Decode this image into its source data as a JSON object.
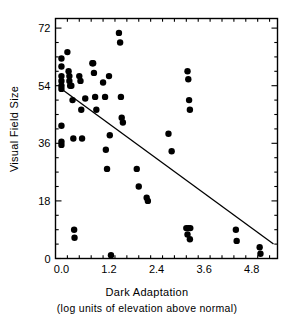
{
  "chart_data": {
    "type": "scatter",
    "title": "",
    "xlabel": "Dark Adaptation",
    "xlabel_sub": "(log units of elevation above normal)",
    "ylabel": "Visual Field Size",
    "xlim": [
      -0.15,
      5.45
    ],
    "ylim": [
      0,
      75
    ],
    "xticks": [
      0.0,
      1.2,
      2.4,
      3.6,
      4.8
    ],
    "xtick_labels": [
      "0.0",
      "1.2",
      "2.4",
      "3.6",
      "4.8"
    ],
    "yticks": [
      0,
      18,
      36,
      54,
      72
    ],
    "ytick_labels": [
      "0",
      "18",
      "36",
      "54",
      "72"
    ],
    "x_minor_step": 0.3,
    "y_minor_step": 4.5,
    "grid": false,
    "legend": null,
    "marker": "filled-circle",
    "marker_color": "#000000",
    "marker_size": 3.2,
    "points": [
      [
        0.0,
        62.5
      ],
      [
        0.0,
        60.0
      ],
      [
        0.0,
        57.0
      ],
      [
        0.0,
        55.5
      ],
      [
        0.0,
        54.0
      ],
      [
        0.0,
        53.0
      ],
      [
        0.0,
        41.5
      ],
      [
        0.0,
        36.5
      ],
      [
        0.0,
        35.5
      ],
      [
        0.15,
        64.5
      ],
      [
        0.18,
        58.5
      ],
      [
        0.2,
        57.0
      ],
      [
        0.2,
        55.5
      ],
      [
        0.22,
        54.0
      ],
      [
        0.25,
        54.0
      ],
      [
        0.28,
        49.5
      ],
      [
        0.3,
        37.5
      ],
      [
        0.32,
        9.0
      ],
      [
        0.33,
        6.5
      ],
      [
        0.45,
        57.0
      ],
      [
        0.48,
        55.5
      ],
      [
        0.5,
        46.5
      ],
      [
        0.52,
        37.5
      ],
      [
        0.6,
        50.0
      ],
      [
        0.78,
        61.0
      ],
      [
        0.8,
        61.0
      ],
      [
        0.82,
        58.0
      ],
      [
        0.85,
        50.5
      ],
      [
        0.88,
        46.5
      ],
      [
        1.05,
        55.0
      ],
      [
        1.1,
        50.5
      ],
      [
        1.12,
        34.0
      ],
      [
        1.15,
        28.0
      ],
      [
        1.2,
        57.0
      ],
      [
        1.22,
        38.5
      ],
      [
        1.25,
        1.0
      ],
      [
        1.45,
        70.5
      ],
      [
        1.48,
        67.5
      ],
      [
        1.5,
        50.5
      ],
      [
        1.52,
        44.0
      ],
      [
        1.55,
        42.5
      ],
      [
        1.9,
        28.0
      ],
      [
        1.95,
        22.5
      ],
      [
        2.15,
        19.0
      ],
      [
        2.18,
        18.0
      ],
      [
        2.7,
        39.0
      ],
      [
        2.78,
        33.5
      ],
      [
        3.18,
        58.5
      ],
      [
        3.2,
        56.0
      ],
      [
        3.22,
        49.5
      ],
      [
        3.24,
        46.5
      ],
      [
        3.15,
        9.5
      ],
      [
        3.2,
        9.5
      ],
      [
        3.25,
        9.5
      ],
      [
        3.18,
        7.5
      ],
      [
        3.24,
        6.0
      ],
      [
        4.4,
        9.0
      ],
      [
        4.42,
        5.5
      ],
      [
        5.0,
        3.5
      ],
      [
        5.02,
        1.5
      ]
    ],
    "fit_line": {
      "label": "regression-line",
      "x_start": 0.0,
      "y_start": 53.0,
      "x_end": 5.35,
      "y_end": 4.5,
      "color": "#000000",
      "width": 1.3
    }
  },
  "figure": {
    "frame_color": "#000000",
    "background": "#ffffff"
  }
}
